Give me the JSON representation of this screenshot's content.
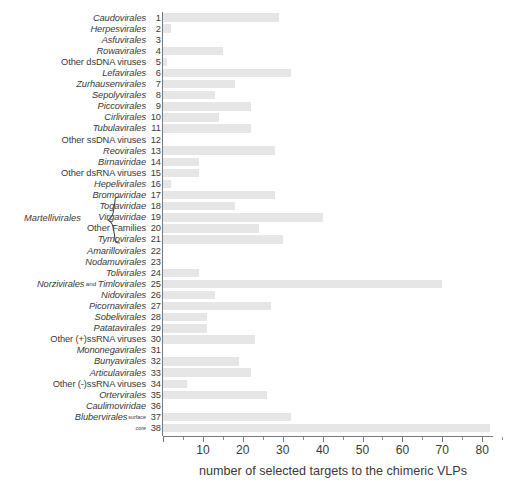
{
  "chart_data": {
    "type": "bar",
    "orientation": "horizontal",
    "title": "",
    "xlabel": "number of selected targets to the chimeric VLPs",
    "ylabel": "",
    "xlim": [
      0,
      84
    ],
    "xticks": [
      0,
      10,
      20,
      30,
      40,
      50,
      60,
      70,
      80
    ],
    "xtick_labels": [
      "",
      "10",
      "20",
      "30",
      "40",
      "50",
      "60",
      "70",
      "80"
    ],
    "grid": false,
    "legend": null,
    "bar_color": "#e6e6e6",
    "axis_color": "#7a7a7a",
    "categories": [
      "Caudovirales",
      "Herpesvirales",
      "Asfuvirales",
      "Rowavirales",
      "Other dsDNA viruses",
      "Lefavirales",
      "Zurhausenvirales",
      "Sepolyvirales",
      "Piccovirales",
      "Cirlivirales",
      "Tubulavirales",
      "Other ssDNA viruses",
      "Reovirales",
      "Birnaviridae",
      "Other dsRNA viruses",
      "Hepelivirales",
      "Bromoviridae",
      "Togaviridae",
      "Virgaviridae",
      "Other Families",
      "Tymovirales",
      "Amarillovirales",
      "Nodamuvirales",
      "Tolivirales",
      "Norzivirales and Timlovirales",
      "Nidovirales",
      "Picornavirales",
      "Sobelivirales",
      "Patatavirales",
      "Other (+)ssRNA viruses",
      "Mononegavirales",
      "Bunyavirales",
      "Articulavirales",
      "Other (-)ssRNA viruses",
      "Ortervirales",
      "Caulimoviridae",
      "Blubervirales surface",
      "Blubervirales core"
    ],
    "values": [
      29,
      2,
      0,
      15,
      1,
      32,
      18,
      13,
      22,
      14,
      22,
      0,
      28,
      9,
      9,
      2,
      28,
      18,
      40,
      24,
      30,
      0,
      0,
      9,
      70,
      13,
      27,
      11,
      11,
      23,
      0,
      19,
      22,
      6,
      26,
      0,
      32,
      82
    ]
  },
  "rows": [
    {
      "num": "1",
      "name": "Caudovirales",
      "italic": true,
      "value": 29
    },
    {
      "num": "2",
      "name": "Herpesvirales",
      "italic": true,
      "value": 2
    },
    {
      "num": "3",
      "name": "Asfuvirales",
      "italic": true,
      "value": 0
    },
    {
      "num": "4",
      "name": "Rowavirales",
      "italic": true,
      "value": 15
    },
    {
      "num": "5",
      "name": "Other dsDNA viruses",
      "italic": false,
      "value": 1
    },
    {
      "num": "6",
      "name": "Lefavirales",
      "italic": true,
      "value": 32
    },
    {
      "num": "7",
      "name": "Zurhausenvirales",
      "italic": true,
      "value": 18
    },
    {
      "num": "8",
      "name": "Sepolyvirales",
      "italic": true,
      "value": 13
    },
    {
      "num": "9",
      "name": "Piccovirales",
      "italic": true,
      "value": 22
    },
    {
      "num": "10",
      "name": "Cirlivirales",
      "italic": true,
      "value": 14
    },
    {
      "num": "11",
      "name": "Tubulavirales",
      "italic": true,
      "value": 22
    },
    {
      "num": "12",
      "name": "Other ssDNA viruses",
      "italic": false,
      "value": 0
    },
    {
      "num": "13",
      "name": "Reovirales",
      "italic": true,
      "value": 28
    },
    {
      "num": "14",
      "name": "Birnaviridae",
      "italic": true,
      "value": 9
    },
    {
      "num": "15",
      "name": "Other dsRNA viruses",
      "italic": false,
      "value": 9
    },
    {
      "num": "16",
      "name": "Hepelivirales",
      "italic": true,
      "value": 2
    },
    {
      "num": "17",
      "name": "Bromoviridae",
      "italic": true,
      "value": 28
    },
    {
      "num": "18",
      "name": "Togaviridae",
      "italic": true,
      "value": 18
    },
    {
      "num": "19",
      "name": "Virgaviridae",
      "italic": true,
      "value": 40
    },
    {
      "num": "20",
      "name": "Other Families",
      "italic": false,
      "value": 24
    },
    {
      "num": "21",
      "name": "Tymovirales",
      "italic": true,
      "value": 30
    },
    {
      "num": "22",
      "name": "Amarillovirales",
      "italic": true,
      "value": 0
    },
    {
      "num": "23",
      "name": "Nodamuvirales",
      "italic": true,
      "value": 0
    },
    {
      "num": "24",
      "name": "Tolivirales",
      "italic": true,
      "value": 9
    },
    {
      "num": "25",
      "name": "Norzivirales",
      "italic": true,
      "value": 70,
      "conj": "and",
      "name2": "Timlovirales"
    },
    {
      "num": "26",
      "name": "Nidovirales",
      "italic": true,
      "value": 13
    },
    {
      "num": "27",
      "name": "Picornavirales",
      "italic": true,
      "value": 27
    },
    {
      "num": "28",
      "name": "Sobelivirales",
      "italic": true,
      "value": 11
    },
    {
      "num": "29",
      "name": "Patatavirales",
      "italic": true,
      "value": 11
    },
    {
      "num": "30",
      "name": "Other (+)ssRNA viruses",
      "italic": false,
      "value": 23
    },
    {
      "num": "31",
      "name": "Mononegavirales",
      "italic": true,
      "value": 0
    },
    {
      "num": "32",
      "name": "Bunyavirales",
      "italic": true,
      "value": 19
    },
    {
      "num": "33",
      "name": "Articulavirales",
      "italic": true,
      "value": 22
    },
    {
      "num": "34",
      "name": "Other (-)ssRNA viruses",
      "italic": false,
      "value": 6
    },
    {
      "num": "35",
      "name": "Ortervirales",
      "italic": true,
      "value": 26
    },
    {
      "num": "36",
      "name": "Caulimoviridae",
      "italic": true,
      "value": 0
    },
    {
      "num": "37",
      "name": "Blubervirales",
      "italic": true,
      "value": 32,
      "sup": "surface"
    },
    {
      "num": "38",
      "name": "",
      "italic": true,
      "value": 82,
      "sup": "core"
    }
  ],
  "bracket": {
    "label": "Martellivirales",
    "covers": [
      "17",
      "18",
      "19",
      "20"
    ]
  },
  "axis": {
    "x_title": "number of selected targets to the chimeric VLPs",
    "ticks": [
      {
        "value": 0,
        "label": ""
      },
      {
        "value": 10,
        "label": "10"
      },
      {
        "value": 20,
        "label": "20"
      },
      {
        "value": 30,
        "label": "30"
      },
      {
        "value": 40,
        "label": "40"
      },
      {
        "value": 50,
        "label": "50"
      },
      {
        "value": 60,
        "label": "60"
      },
      {
        "value": 70,
        "label": "70"
      },
      {
        "value": 80,
        "label": "80"
      }
    ]
  }
}
